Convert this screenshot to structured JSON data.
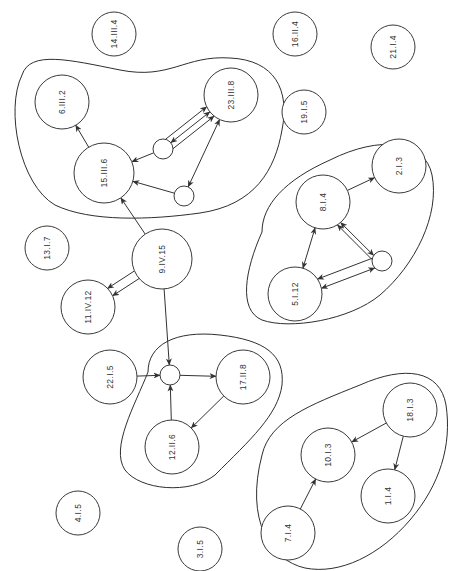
{
  "title": "",
  "colors": {
    "stroke": "#333333",
    "background": "#ffffff",
    "label": "#333333"
  },
  "nodes": [
    {
      "id": "n14",
      "label": "14.III.4",
      "x": 114,
      "y": 34,
      "r": 22
    },
    {
      "id": "n16",
      "label": "16.II.4",
      "x": 295,
      "y": 34,
      "r": 22
    },
    {
      "id": "n21",
      "label": "21.I.4",
      "x": 393,
      "y": 47,
      "r": 22
    },
    {
      "id": "n6",
      "label": "6.III.2",
      "x": 62,
      "y": 102,
      "r": 27
    },
    {
      "id": "n23",
      "label": "23.III.8",
      "x": 231,
      "y": 95,
      "r": 27
    },
    {
      "id": "n19",
      "label": "19.I.5",
      "x": 304,
      "y": 112,
      "r": 22
    },
    {
      "id": "sA",
      "label": "",
      "x": 163,
      "y": 149,
      "r": 10
    },
    {
      "id": "n15",
      "label": "15.III.6",
      "x": 104,
      "y": 173,
      "r": 30
    },
    {
      "id": "sB",
      "label": "",
      "x": 184,
      "y": 196,
      "r": 10
    },
    {
      "id": "n2",
      "label": "2.I.3",
      "x": 399,
      "y": 166,
      "r": 27
    },
    {
      "id": "n8",
      "label": "8.I.4",
      "x": 323,
      "y": 202,
      "r": 27
    },
    {
      "id": "n13",
      "label": "13.I.7",
      "x": 47,
      "y": 248,
      "r": 22
    },
    {
      "id": "n9",
      "label": "9.IV.15",
      "x": 162,
      "y": 259,
      "r": 30
    },
    {
      "id": "sC",
      "label": "",
      "x": 382,
      "y": 261,
      "r": 10
    },
    {
      "id": "n5",
      "label": "5.I.12",
      "x": 295,
      "y": 294,
      "r": 27
    },
    {
      "id": "n11",
      "label": "11.IV.12",
      "x": 88,
      "y": 307,
      "r": 27
    },
    {
      "id": "n22",
      "label": "22.I.5",
      "x": 110,
      "y": 377,
      "r": 27
    },
    {
      "id": "sD",
      "label": "",
      "x": 170,
      "y": 375,
      "r": 10
    },
    {
      "id": "n17",
      "label": "17.II.8",
      "x": 243,
      "y": 377,
      "r": 27
    },
    {
      "id": "n12",
      "label": "12.II.6",
      "x": 172,
      "y": 447,
      "r": 27
    },
    {
      "id": "n18",
      "label": "18.I.3",
      "x": 410,
      "y": 410,
      "r": 27
    },
    {
      "id": "n10",
      "label": "10.I.3",
      "x": 328,
      "y": 455,
      "r": 27
    },
    {
      "id": "n1",
      "label": "1.I.4",
      "x": 388,
      "y": 496,
      "r": 27
    },
    {
      "id": "n4",
      "label": "4.I.5",
      "x": 78,
      "y": 513,
      "r": 22
    },
    {
      "id": "n7",
      "label": "7.I.4",
      "x": 288,
      "y": 533,
      "r": 27
    },
    {
      "id": "n3",
      "label": "3.I.5",
      "x": 200,
      "y": 549,
      "r": 22
    }
  ],
  "edges": [
    {
      "from": "n15",
      "to": "n6",
      "arrow_end": true,
      "arrow_start": false,
      "offset": 0
    },
    {
      "from": "sA",
      "to": "n15",
      "arrow_end": true,
      "arrow_start": false,
      "offset": 0
    },
    {
      "from": "sB",
      "to": "n15",
      "arrow_end": true,
      "arrow_start": false,
      "offset": 0
    },
    {
      "from": "sA",
      "to": "n23",
      "arrow_end": true,
      "arrow_start": false,
      "offset": -6
    },
    {
      "from": "n23",
      "to": "sA",
      "arrow_end": true,
      "arrow_start": true,
      "offset": 0
    },
    {
      "from": "sA",
      "to": "n23",
      "arrow_end": true,
      "arrow_start": false,
      "offset": 6
    },
    {
      "from": "n23",
      "to": "sB",
      "arrow_end": true,
      "arrow_start": true,
      "offset": 0
    },
    {
      "from": "n9",
      "to": "n15",
      "arrow_end": true,
      "arrow_start": false,
      "offset": 0
    },
    {
      "from": "n9",
      "to": "n11",
      "arrow_end": true,
      "arrow_start": false,
      "offset": -4
    },
    {
      "from": "n9",
      "to": "n11",
      "arrow_end": true,
      "arrow_start": false,
      "offset": 5
    },
    {
      "from": "n9",
      "to": "sD",
      "arrow_end": true,
      "arrow_start": false,
      "offset": 0
    },
    {
      "from": "n22",
      "to": "sD",
      "arrow_end": true,
      "arrow_start": false,
      "offset": 0
    },
    {
      "from": "sD",
      "to": "n17",
      "arrow_end": true,
      "arrow_start": false,
      "offset": 0
    },
    {
      "from": "n17",
      "to": "n12",
      "arrow_end": true,
      "arrow_start": false,
      "offset": 0
    },
    {
      "from": "n12",
      "to": "sD",
      "arrow_end": true,
      "arrow_start": false,
      "offset": 0
    },
    {
      "from": "n8",
      "to": "n2",
      "arrow_end": true,
      "arrow_start": false,
      "offset": 0
    },
    {
      "from": "n8",
      "to": "n5",
      "arrow_end": true,
      "arrow_start": true,
      "offset": 0
    },
    {
      "from": "sC",
      "to": "n8",
      "arrow_end": true,
      "arrow_start": false,
      "offset": -6
    },
    {
      "from": "n8",
      "to": "sC",
      "arrow_end": true,
      "arrow_start": true,
      "offset": 2
    },
    {
      "from": "sC",
      "to": "n5",
      "arrow_end": true,
      "arrow_start": true,
      "offset": -4
    },
    {
      "from": "sC",
      "to": "n5",
      "arrow_end": true,
      "arrow_start": false,
      "offset": 6
    },
    {
      "from": "n18",
      "to": "n10",
      "arrow_end": true,
      "arrow_start": false,
      "offset": 0
    },
    {
      "from": "n18",
      "to": "n1",
      "arrow_end": true,
      "arrow_start": false,
      "offset": 0
    },
    {
      "from": "n7",
      "to": "n10",
      "arrow_end": true,
      "arrow_start": false,
      "offset": 0
    }
  ],
  "groups": [
    {
      "id": "cluster-III",
      "path": "M 22 75 C 30 50, 70 60, 120 70 C 170 80, 185 55, 230 58 C 275 60, 290 90, 282 130 C 275 170, 255 205, 200 213 C 150 220, 90 222, 55 205 C 20 185, 5 110, 22 75 Z"
    },
    {
      "id": "cluster-I-right",
      "path": "M 262 232 C 262 205, 285 180, 330 160 C 380 135, 425 140, 432 175 C 440 215, 415 265, 380 295 C 350 320, 290 330, 262 320 C 238 310, 245 270, 262 232 Z"
    },
    {
      "id": "cluster-II",
      "path": "M 148 372 C 148 345, 175 330, 220 335 C 265 340, 285 355, 282 385 C 278 415, 250 440, 215 475 C 190 495, 140 490, 125 470 C 110 448, 135 405, 148 372 Z"
    },
    {
      "id": "cluster-I-bottom",
      "path": "M 262 455 C 270 420, 310 405, 360 385 C 405 365, 440 370, 446 405 C 452 445, 440 485, 410 520 C 380 555, 340 575, 305 568 C 270 560, 245 520, 262 455 Z"
    }
  ]
}
